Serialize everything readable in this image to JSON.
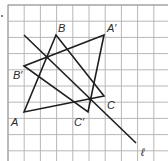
{
  "figure": {
    "grid": {
      "x0": 8,
      "y0": 5,
      "cell": 16.2,
      "cols": 10,
      "rows": 10,
      "line_color": "#b8b8b8",
      "border_color": "#9a9a9a"
    },
    "line_color": "#1e1e1e",
    "triangles": [
      {
        "name": "ABC",
        "vertices": [
          {
            "label": "A",
            "x": 24,
            "y": 112,
            "lx": 11,
            "ly": 126
          },
          {
            "label": "B",
            "x": 56,
            "y": 35,
            "lx": 58,
            "ly": 32
          },
          {
            "label": "C",
            "x": 104,
            "y": 96,
            "lx": 107,
            "ly": 109
          }
        ]
      },
      {
        "name": "A'B'C'",
        "vertices": [
          {
            "label": "A′",
            "x": 104,
            "y": 35,
            "lx": 107,
            "ly": 32
          },
          {
            "label": "B′",
            "x": 24,
            "y": 66,
            "lx": 13,
            "ly": 79
          },
          {
            "label": "C′",
            "x": 88,
            "y": 112,
            "lx": 74,
            "ly": 126
          }
        ]
      }
    ],
    "reflection_line": {
      "label": "ℓ",
      "x1": 24,
      "y1": 35,
      "x2": 136,
      "y2": 143,
      "lx": 141,
      "ly": 156
    },
    "intersection_dots": [
      {
        "x": 47,
        "y": 57
      },
      {
        "x": 90,
        "y": 99
      }
    ],
    "stray_mark": {
      "x": 2,
      "y": 16
    }
  }
}
